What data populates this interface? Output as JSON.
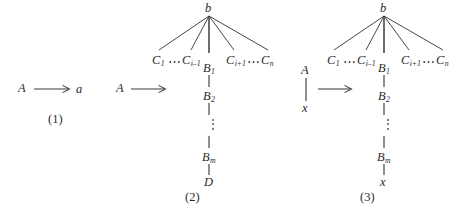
{
  "figure": {
    "background": "#ffffff",
    "ink": "#3c3c3c",
    "text_color": "#2b2b2b"
  },
  "panels": [
    {
      "caption": "(1)",
      "lhs": "A",
      "rhs": "a",
      "arrow": "⟶"
    },
    {
      "caption": "(2)",
      "lhs": "A",
      "arrow": "⟶",
      "root": "b",
      "children": [
        "C",
        "⋯",
        "C",
        "B",
        "C",
        "⋯",
        "C"
      ],
      "child_labels": {
        "first": "C",
        "first_sub": "1",
        "left_last": "C",
        "left_last_sub": "i–1",
        "center": "B",
        "center_sub": "1",
        "right_first": "C",
        "right_first_sub": "i+1",
        "last": "C",
        "last_sub": "n"
      },
      "ellipsis": "⋯",
      "chain": [
        {
          "label": "B",
          "sub": "2"
        },
        {
          "label": "⋮",
          "sub": ""
        },
        {
          "label": "B",
          "sub": "m"
        },
        {
          "label": "D",
          "sub": ""
        }
      ],
      "vertical_ellipsis": "⋮",
      "terminal": "D"
    },
    {
      "caption": "(3)",
      "lhs": "A",
      "lhs_child": "x",
      "arrow": "⟶",
      "root": "b",
      "child_labels": {
        "first": "C",
        "first_sub": "1",
        "left_last": "C",
        "left_last_sub": "i–1",
        "center": "B",
        "center_sub": "1",
        "right_first": "C",
        "right_first_sub": "i+1",
        "last": "C",
        "last_sub": "n"
      },
      "ellipsis": "⋯",
      "chain": [
        {
          "label": "B",
          "sub": "2"
        },
        {
          "label": "⋮",
          "sub": ""
        },
        {
          "label": "B",
          "sub": "m"
        },
        {
          "label": "x",
          "sub": ""
        }
      ],
      "vertical_ellipsis": "⋮",
      "terminal": "x"
    }
  ]
}
